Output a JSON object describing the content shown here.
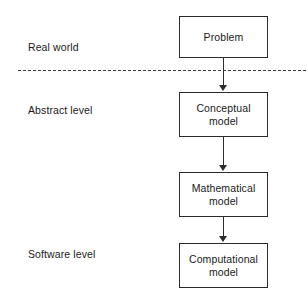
{
  "diagram": {
    "background_color": "#ffffff",
    "stroke_color": "#2b2b2b",
    "text_color": "#1a1a1a",
    "divider_color": "#3a3a3a",
    "levels": [
      {
        "id": "real-world",
        "label": "Real world"
      },
      {
        "id": "abstract-level",
        "label": "Abstract level"
      },
      {
        "id": "software-level",
        "label": "Software level"
      }
    ],
    "nodes": [
      {
        "id": "problem",
        "label": "Problem"
      },
      {
        "id": "conceptual-model",
        "label": "Conceptual\nmodel"
      },
      {
        "id": "mathematical-model",
        "label": "Mathematical\nmodel"
      },
      {
        "id": "computational-model",
        "label": "Computational\nmodel"
      }
    ],
    "node_labels": {
      "problem": "Problem",
      "conceptual_line1": "Conceptual",
      "conceptual_line2": "model",
      "mathematical_line1": "Mathematical",
      "mathematical_line2": "model",
      "computational_line1": "Computational",
      "computational_line2": "model"
    },
    "edges": [
      {
        "from": "problem",
        "to": "conceptual-model",
        "style": "solid-arrow-down"
      },
      {
        "from": "conceptual-model",
        "to": "mathematical-model",
        "style": "solid-arrow-down"
      },
      {
        "from": "mathematical-model",
        "to": "computational-model",
        "style": "solid-arrow-down"
      }
    ],
    "divider": {
      "style": "dashed",
      "separates": [
        "Real world",
        "Abstract level"
      ]
    }
  }
}
